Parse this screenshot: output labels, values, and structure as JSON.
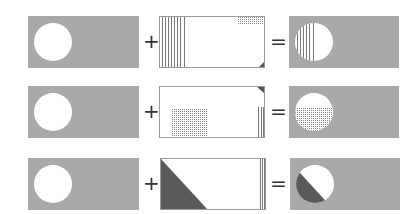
{
  "colors": {
    "gray": "#a9a9a9",
    "dark": "#5a5a5a",
    "white": "#ffffff",
    "stroke": "#9a9a9a"
  },
  "operators": {
    "plus": "+",
    "equals": "="
  },
  "rows": [
    {
      "source": "gray-rect-white-circle",
      "mask": "vertical-lines-left-band, dotted-top-right, dark-corner-bottom-right",
      "result": "circle-with-vertical-lines-left-half"
    },
    {
      "source": "gray-rect-white-circle",
      "mask": "dark-corner-top-right, dotted-lower-left-block, vertical-lines-right-edge",
      "result": "circle-with-dotted-lower-half"
    },
    {
      "source": "gray-rect-white-circle",
      "mask": "dark-triangle-lower-left, vertical-lines-right-edge",
      "result": "circle-with-dark-lower-left-half"
    }
  ]
}
